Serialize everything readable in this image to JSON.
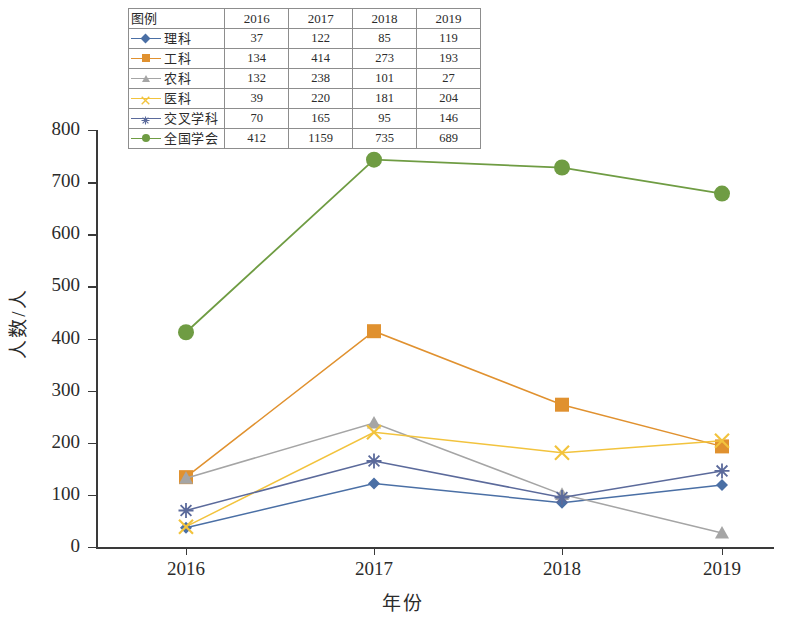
{
  "chart_data": {
    "type": "line",
    "title": "",
    "xlabel": "年份",
    "ylabel": "人数/人",
    "categories": [
      "2016",
      "2017",
      "2018",
      "2019"
    ],
    "ylim": [
      0,
      800
    ],
    "ytick_values": [
      0,
      100,
      200,
      300,
      400,
      500,
      600,
      700,
      800
    ],
    "grid": false,
    "legend_position": "top-inside-table",
    "series": [
      {
        "name": "理科",
        "values": [
          37,
          122,
          85,
          119
        ],
        "plotted": [
          37,
          122,
          85,
          119
        ],
        "color": "#4a6fa5",
        "marker": "diamond"
      },
      {
        "name": "工科",
        "values": [
          134,
          414,
          273,
          193
        ],
        "plotted": [
          134,
          414,
          273,
          193
        ],
        "color": "#e0912f",
        "marker": "square"
      },
      {
        "name": "农科",
        "values": [
          132,
          238,
          101,
          27
        ],
        "plotted": [
          132,
          238,
          101,
          27
        ],
        "color": "#a5a5a5",
        "marker": "triangle"
      },
      {
        "name": "医科",
        "values": [
          39,
          220,
          181,
          204
        ],
        "plotted": [
          39,
          220,
          181,
          204
        ],
        "color": "#f2c33d",
        "marker": "cross"
      },
      {
        "name": "交叉学科",
        "values": [
          70,
          165,
          95,
          146
        ],
        "plotted": [
          70,
          165,
          95,
          146
        ],
        "color": "#5b6a9b",
        "marker": "star"
      },
      {
        "name": "全国学会",
        "values": [
          412,
          1159,
          735,
          689
        ],
        "plotted": [
          412,
          743,
          728,
          678
        ],
        "color": "#6f9c43",
        "marker": "circle"
      }
    ]
  },
  "legend_table": {
    "header": [
      "图例",
      "2016",
      "2017",
      "2018",
      "2019"
    ],
    "rows": [
      {
        "name": "理科",
        "v2016": "37",
        "v2017": "122",
        "v2018": "85",
        "v2019": "119"
      },
      {
        "name": "工科",
        "v2016": "134",
        "v2017": "414",
        "v2018": "273",
        "v2019": "193"
      },
      {
        "name": "农科",
        "v2016": "132",
        "v2017": "238",
        "v2018": "101",
        "v2019": "27"
      },
      {
        "name": "医科",
        "v2016": "39",
        "v2017": "220",
        "v2018": "181",
        "v2019": "204"
      },
      {
        "name": "交叉学科",
        "v2016": "70",
        "v2017": "165",
        "v2018": "95",
        "v2019": "146"
      },
      {
        "name": "全国学会",
        "v2016": "412",
        "v2017": "1159",
        "v2018": "735",
        "v2019": "689"
      }
    ]
  },
  "axes": {
    "y_title": "人数/人",
    "x_title": "年份",
    "y_ticks": [
      "800",
      "700",
      "600",
      "500",
      "400",
      "300",
      "200",
      "100",
      "0"
    ],
    "x_ticks": [
      "2016",
      "2017",
      "2018",
      "2019"
    ]
  },
  "colors": {
    "axis": "#3a3a3a",
    "grid_border": "#8d8d8d",
    "background": "#ffffff"
  }
}
